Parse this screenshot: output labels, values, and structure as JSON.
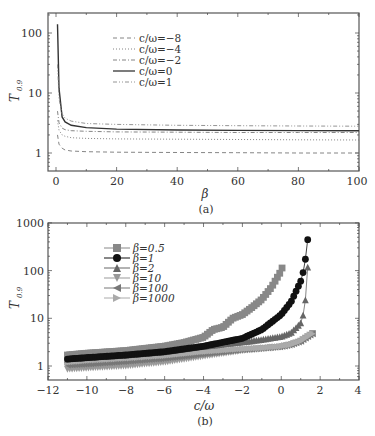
{
  "chart_data": [
    {
      "panel": "(a)",
      "type": "line",
      "title": "",
      "xlabel": "β",
      "ylabel": "T0.9",
      "xlim": [
        -3,
        100
      ],
      "ylim": [
        0.5,
        215
      ],
      "yscale": "log",
      "xticks": [
        "0",
        "20",
        "40",
        "60",
        "80",
        "100"
      ],
      "yticks": [
        "1",
        "10",
        "100"
      ],
      "legend_position": "upper center",
      "caption": "(a)",
      "x": [
        0.5,
        1,
        2,
        3,
        5,
        10,
        20,
        40,
        60,
        80,
        100
      ],
      "series": [
        {
          "name": "c/ω=−8",
          "style": "dashed",
          "values": [
            2.0,
            1.4,
            1.2,
            1.12,
            1.08,
            1.05,
            1.03,
            1.02,
            1.01,
            1.0,
            1.0
          ]
        },
        {
          "name": "c/ω=−4",
          "style": "dotted",
          "values": [
            3.5,
            2.4,
            2.0,
            1.9,
            1.8,
            1.75,
            1.72,
            1.7,
            1.68,
            1.66,
            1.65
          ]
        },
        {
          "name": "c/ω=−2",
          "style": "dashdot",
          "values": [
            5.0,
            3.2,
            2.6,
            2.45,
            2.35,
            2.3,
            2.25,
            2.22,
            2.2,
            2.2,
            2.2
          ]
        },
        {
          "name": "c/ω=0",
          "style": "solid",
          "values": [
            140,
            12,
            4.0,
            3.3,
            2.9,
            2.65,
            2.5,
            2.42,
            2.38,
            2.36,
            2.35
          ]
        },
        {
          "name": "c/ω=1",
          "style": "dashdotdot",
          "values": [
            30,
            8,
            4.5,
            3.8,
            3.4,
            3.1,
            3.0,
            2.9,
            2.85,
            2.82,
            2.8
          ]
        }
      ]
    },
    {
      "panel": "(b)",
      "type": "scatter",
      "title": "",
      "xlabel": "c/ω",
      "ylabel": "T0.9",
      "xlim": [
        -12,
        4
      ],
      "ylim": [
        0.5,
        1000
      ],
      "yscale": "log",
      "xticks": [
        "−12",
        "−10",
        "−8",
        "−6",
        "−4",
        "−2",
        "0",
        "2",
        "4"
      ],
      "yticks": [
        "1",
        "10",
        "100",
        "1000"
      ],
      "legend_position": "upper left",
      "caption": "(b)",
      "series": [
        {
          "name": "β=0.5",
          "marker": "square",
          "color": "#888888",
          "x": [
            -11,
            -10,
            -8,
            -6,
            -5,
            -4,
            -3.5,
            -3,
            -2.5,
            -2,
            -1.5,
            -1,
            -0.5,
            0,
            0.15
          ],
          "values": [
            1.7,
            1.85,
            2.1,
            2.6,
            3.1,
            4.0,
            5.8,
            6.5,
            10,
            12,
            17,
            25,
            45,
            100,
            160
          ]
        },
        {
          "name": "β=1",
          "marker": "circle",
          "color": "#111111",
          "x": [
            -11,
            -10,
            -8,
            -6,
            -4,
            -2,
            -1,
            0,
            0.5,
            1,
            1.2,
            1.3,
            1.4
          ],
          "values": [
            1.4,
            1.5,
            1.7,
            2.0,
            2.6,
            3.8,
            5.8,
            12,
            22,
            60,
            120,
            300,
            580
          ]
        },
        {
          "name": "β=2",
          "marker": "triangle-up",
          "color": "#666666",
          "x": [
            -11,
            -10,
            -8,
            -6,
            -4,
            -2,
            -1,
            0,
            0.5,
            1,
            1.2,
            1.3,
            1.4
          ],
          "values": [
            1.4,
            1.5,
            1.7,
            2.0,
            2.6,
            3.2,
            3.6,
            4.2,
            5.0,
            8,
            15,
            50,
            210
          ]
        },
        {
          "name": "β=10",
          "marker": "triangle-down",
          "color": "#999999",
          "x": [
            -11,
            -10,
            -8,
            -6,
            -4,
            -2,
            -1,
            0,
            0.5,
            1,
            1.5,
            1.7
          ],
          "values": [
            0.85,
            0.9,
            1.0,
            1.2,
            1.6,
            2.1,
            2.3,
            2.5,
            2.8,
            3.3,
            4.5,
            5.2
          ]
        },
        {
          "name": "β=100",
          "marker": "triangle-left",
          "color": "#777777",
          "x": [
            -11,
            -10,
            -8,
            -6,
            -4,
            -2,
            -1,
            0,
            0.5,
            1,
            1.5,
            1.7
          ],
          "values": [
            1.05,
            1.1,
            1.25,
            1.45,
            1.8,
            2.2,
            2.35,
            2.55,
            2.8,
            3.3,
            4.5,
            5.0
          ]
        },
        {
          "name": "β=1000",
          "marker": "triangle-right",
          "color": "#aaaaaa",
          "x": [
            -11,
            -10,
            -8,
            -6,
            -4,
            -2,
            -1,
            0,
            0.5,
            1,
            1.5,
            1.7
          ],
          "values": [
            1.2,
            1.3,
            1.45,
            1.65,
            2.0,
            2.3,
            2.4,
            2.6,
            2.8,
            3.3,
            4.5,
            5.0
          ]
        }
      ]
    }
  ],
  "panel_a": {
    "ylabel": "T",
    "ylabel_sub": "0.9",
    "xlabel": "β",
    "caption": "(a)",
    "xticks": [
      "0",
      "20",
      "40",
      "60",
      "80",
      "100"
    ],
    "yticks": [
      "1",
      "10",
      "100"
    ],
    "legend": [
      "c/ω=−8",
      "c/ω=−4",
      "c/ω=−2",
      "c/ω=0",
      "c/ω=1"
    ]
  },
  "panel_b": {
    "ylabel": "T",
    "ylabel_sub": "0.9",
    "xlabel": "c/ω",
    "caption": "(b)",
    "xticks": [
      "−12",
      "−10",
      "−8",
      "−6",
      "−4",
      "−2",
      "0",
      "2",
      "4"
    ],
    "yticks": [
      "1",
      "10",
      "100",
      "1000"
    ],
    "legend": [
      "β=0.5",
      "β=1",
      "β=2",
      "β=10",
      "β=100",
      "β=1000"
    ]
  }
}
